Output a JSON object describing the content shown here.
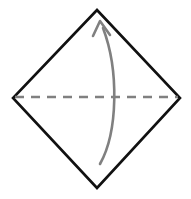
{
  "canvas": {
    "width": 191,
    "height": 199,
    "background_color": "#ffffff",
    "title": "Origami fold diagram"
  },
  "colors": {
    "outline": "#111111",
    "fold_line": "#808080",
    "arrow": "#808080"
  },
  "shapes": {
    "diamond": {
      "name": "square rotated 45 degrees",
      "stroke_color": "#111111",
      "stroke_width": 2.6,
      "fill": "none",
      "vertices": {
        "top": [
          97,
          10
        ],
        "right": [
          180,
          98
        ],
        "bottom": [
          97,
          188
        ],
        "left": [
          13,
          98
        ]
      },
      "points": "97,10 180,98 97,188 13,98"
    },
    "fold_line": {
      "name": "horizontal dashed valley fold",
      "stroke_color": "#808080",
      "stroke_width": 2.4,
      "dash_pattern": "9 7",
      "start": [
        15,
        97
      ],
      "end": [
        178,
        97
      ]
    },
    "fold_arrow": {
      "name": "curved fold arrow pointing up",
      "stroke_color": "#808080",
      "stroke_width": 2.6,
      "direction": "bottom-to-top",
      "bulge": "right",
      "tail_point": [
        100,
        164
      ],
      "tip_point": [
        100,
        21
      ],
      "curve_path": "M 100 164 C 118 132 119 70 103 28",
      "arrowhead": {
        "tip": [
          100,
          21
        ],
        "left_wing": [
          93,
          36
        ],
        "right_wing": [
          110,
          35
        ],
        "stroke_width": 2.6
      }
    }
  },
  "chart_data": {
    "type": "diagram",
    "elements": [
      {
        "name": "paper-outline",
        "shape": "diamond",
        "stroke": "#111111",
        "vertices": [
          [
            97,
            10
          ],
          [
            180,
            98
          ],
          [
            97,
            188
          ],
          [
            13,
            98
          ]
        ]
      },
      {
        "name": "valley-fold-line",
        "shape": "dashed-line",
        "stroke": "#808080",
        "from": [
          15,
          97
        ],
        "to": [
          178,
          97
        ]
      },
      {
        "name": "fold-direction-arrow",
        "shape": "curved-arrow",
        "stroke": "#808080",
        "from": [
          100,
          164
        ],
        "to": [
          100,
          21
        ],
        "curvature": "bulges right"
      }
    ]
  }
}
